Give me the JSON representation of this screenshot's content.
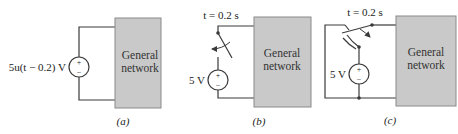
{
  "figure": {
    "colors": {
      "wire": "#3a3a3a",
      "box_fill": "#c9c9c9",
      "box_stroke": "#8a8a8a",
      "text": "#222222"
    },
    "panels": [
      {
        "id": "a",
        "caption": "(a)",
        "source_label": "5u(t − 0.2) V",
        "source_plus": "+",
        "source_minus": "−",
        "box_line1": "General",
        "box_line2": "network"
      },
      {
        "id": "b",
        "caption": "(b)",
        "switch_label": "t = 0.2 s",
        "source_label": "5 V",
        "source_plus": "+",
        "source_minus": "−",
        "box_line1": "General",
        "box_line2": "network"
      },
      {
        "id": "c",
        "caption": "(c)",
        "switch_label": "t = 0.2 s",
        "source_label": "5 V",
        "source_plus": "+",
        "source_minus": "−",
        "box_line1": "General",
        "box_line2": "network"
      }
    ]
  }
}
